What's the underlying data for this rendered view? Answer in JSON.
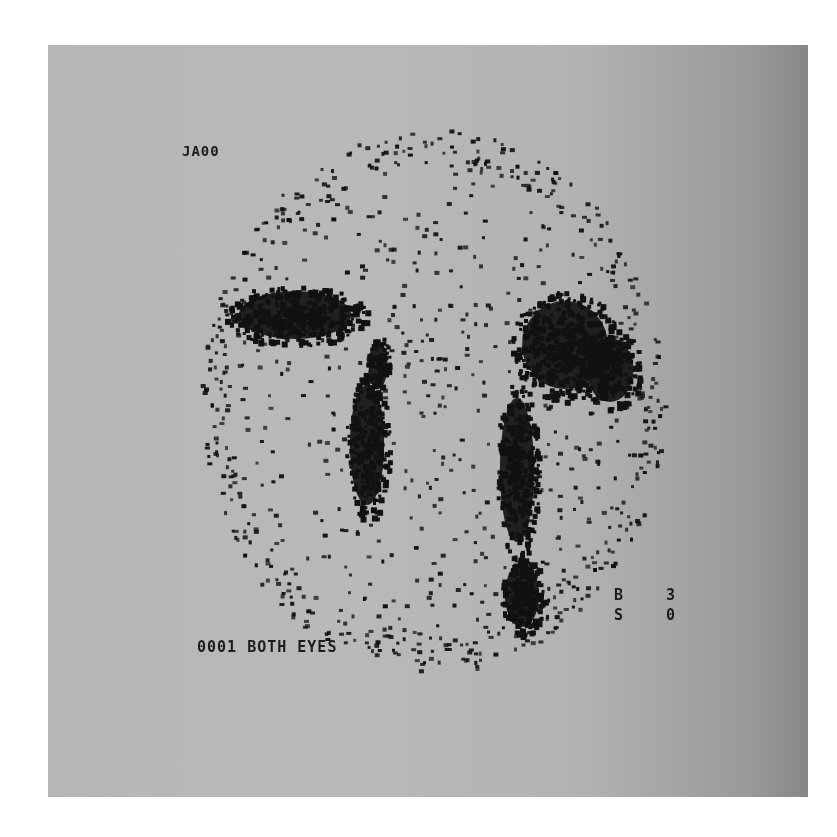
{
  "image": {
    "description": "Nuclear medicine scintigraphy scan printout (dacryoscintigraphy, both eyes)",
    "panel_colors": {
      "left": "#b6b6b6",
      "right": "#878787",
      "background": "#ffffff",
      "counts": "#111111"
    }
  },
  "labels": {
    "patient_id": "JA00",
    "study": "0001 BOTH EYES",
    "b_label": "B",
    "b_value": "3",
    "s_label": "S",
    "s_value": "0"
  },
  "scan": {
    "outline": {
      "cx": 432,
      "cy": 400,
      "rx": 232,
      "ry": 272
    },
    "sparse_dot_count": 900,
    "blobs": [
      {
        "name": "left-upper-activity",
        "cx": 295,
        "cy": 315,
        "rx": 72,
        "ry": 30,
        "density": 380
      },
      {
        "name": "left-canal-activity",
        "cx": 367,
        "cy": 445,
        "rx": 22,
        "ry": 75,
        "density": 260
      },
      {
        "name": "left-connector",
        "cx": 378,
        "cy": 365,
        "rx": 12,
        "ry": 30,
        "density": 60
      },
      {
        "name": "right-upper-activity",
        "cx": 565,
        "cy": 345,
        "rx": 55,
        "ry": 55,
        "density": 420
      },
      {
        "name": "right-lateral-activity",
        "cx": 610,
        "cy": 370,
        "rx": 30,
        "ry": 40,
        "density": 160
      },
      {
        "name": "right-canal-activity",
        "cx": 517,
        "cy": 470,
        "rx": 22,
        "ry": 90,
        "density": 300
      },
      {
        "name": "right-lower-activity",
        "cx": 522,
        "cy": 595,
        "rx": 22,
        "ry": 40,
        "density": 200
      }
    ]
  }
}
